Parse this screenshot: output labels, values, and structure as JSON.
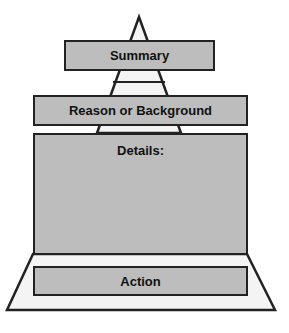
{
  "diagram": {
    "type": "pyramid",
    "levels": [
      {
        "label": "Summary"
      },
      {
        "label": "Reason or Background"
      },
      {
        "label": "Details:"
      },
      {
        "label": "Action"
      }
    ],
    "colors": {
      "box_fill": "#bdbdbd",
      "outline": "#222222",
      "background": "#ffffff"
    }
  }
}
